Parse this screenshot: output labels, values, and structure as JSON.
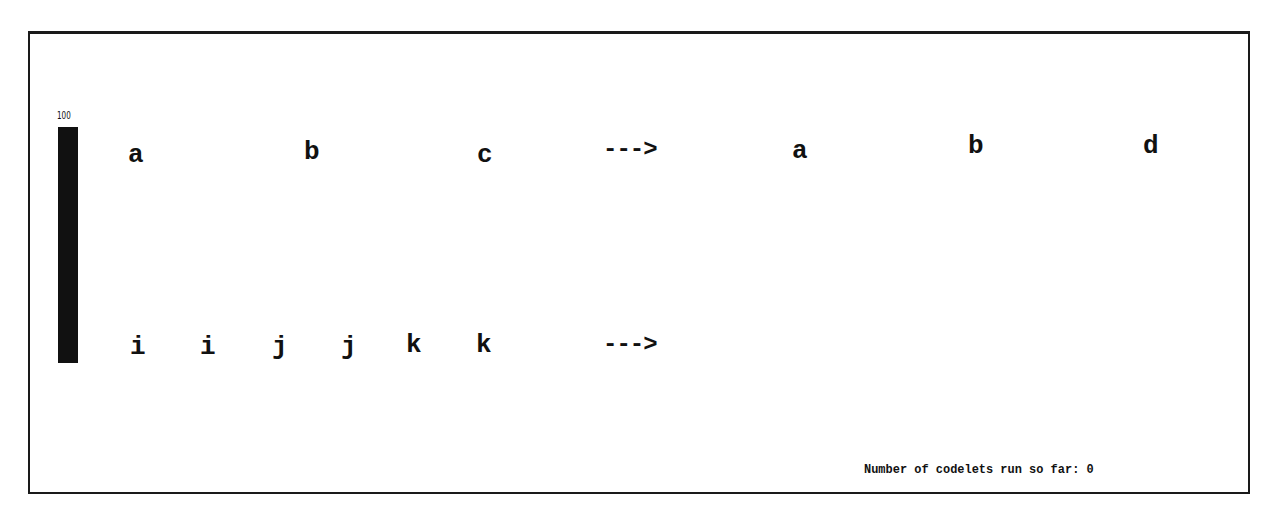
{
  "temperature": {
    "value_label": "100",
    "percent": 100
  },
  "initial_string": {
    "letters": [
      {
        "char": "a",
        "x": 128,
        "y": 142
      },
      {
        "char": "b",
        "x": 304,
        "y": 139
      },
      {
        "char": "c",
        "x": 477,
        "y": 142
      }
    ],
    "arrow": "--->"
  },
  "modified_string": {
    "letters": [
      {
        "char": "a",
        "x": 792,
        "y": 138
      },
      {
        "char": "b",
        "x": 968,
        "y": 133
      },
      {
        "char": "d",
        "x": 1143,
        "y": 133
      }
    ]
  },
  "target_string": {
    "letters": [
      {
        "char": "i",
        "x": 130,
        "y": 334
      },
      {
        "char": "i",
        "x": 200,
        "y": 334
      },
      {
        "char": "j",
        "x": 272,
        "y": 334
      },
      {
        "char": "j",
        "x": 341,
        "y": 334
      },
      {
        "char": "k",
        "x": 406,
        "y": 332
      },
      {
        "char": "k",
        "x": 476,
        "y": 332
      }
    ],
    "arrow": "--->"
  },
  "status": {
    "text": "Number of codelets run so far: 0"
  }
}
